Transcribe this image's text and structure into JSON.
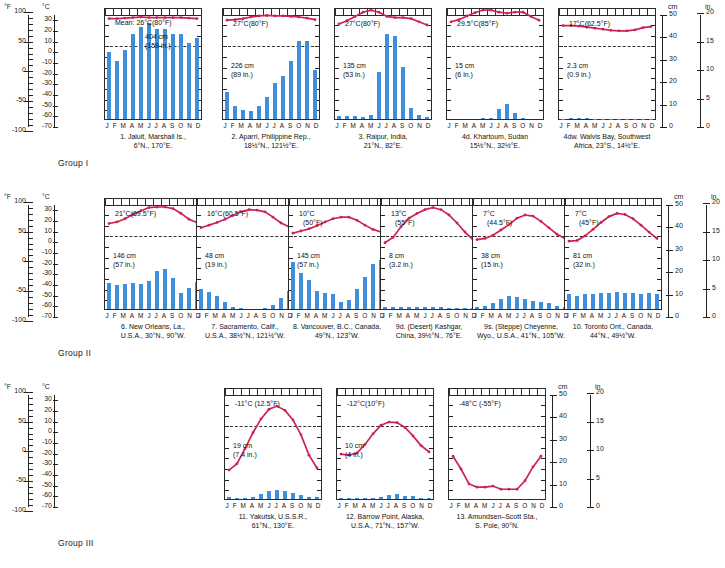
{
  "figure": {
    "temp_header": "Temp.",
    "precip_header": "Precip.",
    "groups": [
      "Group I",
      "Group II",
      "Group III"
    ]
  },
  "axes": {
    "left_f_label": "°F",
    "left_c_label": "°C",
    "right_cm_label": "cm",
    "right_in_label": "in.",
    "f_ticks": [
      "100",
      "50",
      "0",
      "-50",
      "-100"
    ],
    "c_ticks": [
      "30",
      "20",
      "10",
      "0",
      "-10",
      "-20",
      "-30",
      "-40",
      "-50",
      "-60",
      "-70"
    ],
    "cm_ticks": [
      "50",
      "40",
      "30",
      "20",
      "10",
      "0"
    ],
    "in_ticks": [
      "20",
      "15",
      "10",
      "5",
      "0"
    ],
    "months": [
      "J",
      "F",
      "M",
      "A",
      "M",
      "J",
      "J",
      "A",
      "S",
      "O",
      "N",
      "D"
    ]
  },
  "chart_data": {
    "type": "line",
    "xlabel": "Month",
    "ylabel": "Temperature (°C / °F) and Precipitation (cm / in.)",
    "x": [
      "J",
      "F",
      "M",
      "A",
      "M",
      "J",
      "J",
      "A",
      "S",
      "O",
      "N",
      "D"
    ],
    "ylim_temp_c": [
      -70,
      35
    ],
    "ylim_precip_cm": [
      0,
      50
    ],
    "grid": false,
    "legend": "none",
    "panels": [
      {
        "group": "Group I",
        "number": "1.",
        "caption_line1": "1. Jaluit, Marshall Is.,",
        "caption_line2": "6°N., 170°E.",
        "mean_temp_label": "Mean: 26°C(80°F)",
        "annual_precip_cm": "404 cm",
        "annual_precip_in": "(159 in.)",
        "temp_c": [
          26,
          26,
          26.5,
          27,
          27.5,
          27,
          27,
          27,
          27,
          27,
          26.5,
          26
        ],
        "precip_cm": [
          30,
          26,
          31,
          38,
          41,
          43,
          40,
          40,
          38,
          38,
          34,
          36
        ]
      },
      {
        "group": "Group I",
        "number": "2.",
        "caption_line1": "2. Aparri, Philippine Rep.,",
        "caption_line2": "18½°N., 121½°E.",
        "mean_temp_label": "27°C(80°F)",
        "annual_precip_cm": "226 cm",
        "annual_precip_in": "(89 in.)",
        "temp_c": [
          24.5,
          25,
          26,
          27.5,
          28.5,
          29,
          28.5,
          28.5,
          28,
          27.5,
          26.5,
          25
        ],
        "precip_cm": [
          12,
          6,
          4,
          3.5,
          6,
          10,
          16,
          19,
          26,
          35,
          35,
          22
        ]
      },
      {
        "group": "Group I",
        "number": "3.",
        "caption_line1": "3. Raipur, India,",
        "caption_line2": "21°N., 82°E.",
        "mean_temp_label": "27°C(80°F)",
        "annual_precip_cm": "135 cm",
        "annual_precip_in": "(53 in.)",
        "temp_c": [
          21,
          24,
          28,
          32,
          34,
          32,
          28,
          27,
          27,
          26,
          23,
          20
        ],
        "precip_cm": [
          1.5,
          1.5,
          1.5,
          1,
          2,
          21,
          38,
          37,
          23,
          5,
          2,
          1
        ]
      },
      {
        "group": "Group I",
        "number": "4d.",
        "caption_line1": "4d. Khartoum, Sudan",
        "caption_line2": "15½°N., 32½°E.",
        "mean_temp_label": "29.5°C(85°F)",
        "annual_precip_cm": "15 cm",
        "annual_precip_in": "(6 in.)",
        "temp_c": [
          23,
          25,
          28.5,
          31.5,
          34,
          34,
          32,
          31,
          32,
          32,
          28,
          24.5
        ],
        "precip_cm": [
          0,
          0,
          0,
          0,
          0.3,
          0.5,
          4.5,
          6.5,
          2.5,
          0.5,
          0,
          0
        ]
      },
      {
        "group": "Group I",
        "number": "4dw.",
        "caption_line1": "4dw. Walvis Bay, Southwest",
        "caption_line2": "Africa, 23°S., 14½°E.",
        "mean_temp_label": "17°C(62.5°F)",
        "annual_precip_cm": "2.3 cm",
        "annual_precip_in": "(0.9 in.)",
        "temp_c": [
          19.5,
          19.5,
          19,
          18,
          17,
          16,
          15,
          14.5,
          14.5,
          15.5,
          17.5,
          18.5
        ],
        "precip_cm": [
          0.2,
          0.3,
          0.4,
          0.3,
          0.2,
          0.1,
          0.1,
          0.1,
          0.1,
          0.1,
          0.2,
          0.2
        ]
      },
      {
        "group": "Group II",
        "number": "6.",
        "caption_line1": "6. New Orleans, La.,",
        "caption_line2": "U.S.A., 30°N., 90°W.",
        "mean_temp_label": "21°C(69.5°F)",
        "annual_precip_cm": "146 cm",
        "annual_precip_in": "(57 in.)",
        "temp_c": [
          12,
          13.5,
          16.5,
          20.5,
          24,
          27,
          27.5,
          27.5,
          26,
          21.5,
          16,
          13
        ],
        "precip_cm": [
          11.5,
          10.5,
          11,
          11.5,
          11,
          12.5,
          17,
          18,
          14,
          7,
          9.5,
          12
        ]
      },
      {
        "group": "Group II",
        "number": "7.",
        "caption_line1": "7. Sacramento, Calif.,",
        "caption_line2": "U.S.A., 38½°N., 121½°W.",
        "mean_temp_label": "16°C(60.5°F)",
        "annual_precip_cm": "48 cm",
        "annual_precip_in": "(19 in.)",
        "temp_c": [
          8,
          10.5,
          13,
          16,
          19.5,
          23,
          25,
          24.5,
          23,
          18,
          12.5,
          9
        ],
        "precip_cm": [
          9,
          7.5,
          6,
          3,
          1,
          0.3,
          0,
          0,
          0.5,
          2,
          5,
          8
        ]
      },
      {
        "group": "Group II",
        "number": "8.",
        "caption_line1": "8. Vancouver, B.C., Canada,",
        "caption_line2": "49°N., 123°W.",
        "mean_temp_label": "10°C",
        "mean_temp_label2": "(50°F)",
        "annual_precip_cm": "145 cm",
        "annual_precip_in": "(57 in.)",
        "temp_c": [
          3,
          5,
          7,
          10,
          13.5,
          16.5,
          18,
          18,
          15,
          10.5,
          6.5,
          4
        ],
        "precip_cm": [
          21,
          16,
          13,
          8,
          7,
          6.5,
          3,
          4,
          9,
          14.5,
          20,
          22
        ]
      },
      {
        "group": "Group II",
        "number": "9d.",
        "caption_line1": "9d. (Desert) Kashgar,",
        "caption_line2": "China, 39½°N., 76°E.",
        "mean_temp_label": "13°C",
        "mean_temp_label2": "(55°F)",
        "annual_precip_cm": "8 cm",
        "annual_precip_in": "(3.2 in.)",
        "temp_c": [
          -6,
          -1,
          9,
          17,
          21.5,
          25,
          27,
          25,
          20,
          12.5,
          4,
          -3
        ],
        "precip_cm": [
          0.8,
          0.8,
          1,
          0.8,
          1,
          0.8,
          0.7,
          0.7,
          0.4,
          0.3,
          0.3,
          0.5
        ]
      },
      {
        "group": "Group II",
        "number": "9s.",
        "caption_line1": "9s. (Steppe) Cheyenne,",
        "caption_line2": "Wyo., U.S.A., 41°N., 105°W.",
        "mean_temp_label": "7°C",
        "mean_temp_label2": "(44.5°F)",
        "annual_precip_cm": "38 cm",
        "annual_precip_in": "(15 in.)",
        "temp_c": [
          -3,
          -2,
          1,
          6,
          11,
          17,
          20,
          19,
          14,
          8,
          2,
          -2
        ],
        "precip_cm": [
          1,
          1.5,
          2.5,
          4.5,
          6,
          5.5,
          4.5,
          3.5,
          3,
          2.5,
          1.5,
          1
        ]
      },
      {
        "group": "Group II",
        "number": "10.",
        "caption_line1": "10. Toronto Ont., Canada,",
        "caption_line2": "44°N., 49½°W.",
        "mean_temp_label": "7°C",
        "mean_temp_label2": "(45°F)",
        "annual_precip_cm": "81 cm",
        "annual_precip_in": "(32 in.)",
        "temp_c": [
          -4.5,
          -4,
          0.5,
          6.5,
          13,
          18.5,
          21.5,
          20.5,
          16.5,
          10.5,
          4,
          -2
        ],
        "precip_cm": [
          6.5,
          6,
          6.5,
          6.5,
          7,
          7,
          7.5,
          7,
          7,
          6.5,
          7,
          6.5
        ]
      },
      {
        "group": "Group III",
        "number": "11.",
        "caption_line1": "11. Yakutsk, U.S.S.R.,",
        "caption_line2": "61°N., 130°E.",
        "mean_temp_label": "-11°C (12.5°F)",
        "annual_precip_cm": "19 cm",
        "annual_precip_in": "(7.4 in.)",
        "temp_c": [
          -41,
          -35,
          -21,
          -6,
          7,
          16,
          19,
          15,
          6,
          -8,
          -27,
          -39
        ],
        "precip_cm": [
          0.7,
          0.6,
          0.6,
          0.8,
          2.2,
          3.5,
          4,
          3.5,
          2.5,
          1.8,
          1,
          0.9
        ]
      },
      {
        "group": "Group III",
        "number": "12.",
        "caption_line1": "12. Barrow Point, Alaska,",
        "caption_line2": "U.S.A., 71°N., 157°W.",
        "mean_temp_label": "-12°C(10°F)",
        "annual_precip_cm": "10 cm",
        "annual_precip_in": "(4 in.)",
        "temp_c": [
          -26,
          -27,
          -25,
          -17,
          -7,
          1,
          4,
          3.5,
          -1,
          -9,
          -18,
          -24
        ],
        "precip_cm": [
          0.4,
          0.3,
          0.3,
          0.3,
          0.4,
          0.8,
          2,
          2.3,
          1.5,
          1.2,
          0.6,
          0.4
        ]
      },
      {
        "group": "Group III",
        "number": "13.",
        "caption_line1": "13. Amundsen–Scott Sta.,",
        "caption_line2": "S. Pole, 90°N.",
        "mean_temp_label": "-48°C (-55°F)",
        "annual_precip_cm": "",
        "annual_precip_in": "",
        "temp_c": [
          -28,
          -40,
          -54,
          -57,
          -57,
          -56,
          -59,
          -59,
          -59,
          -51,
          -38,
          -28
        ],
        "precip_cm": [
          0,
          0,
          0,
          0,
          0,
          0,
          0,
          0,
          0,
          0,
          0,
          0
        ]
      }
    ]
  }
}
